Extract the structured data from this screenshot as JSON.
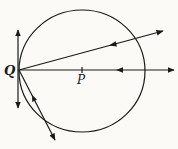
{
  "diagram": {
    "type": "geometry-optics",
    "labels": {
      "q": "Q",
      "p": "P"
    },
    "circle": {
      "cx": 82,
      "cy": 71,
      "rx": 63,
      "ry": 61
    },
    "point_q": {
      "x": 19,
      "y": 70
    },
    "point_p": {
      "x": 82,
      "y": 70
    },
    "lines": [
      {
        "name": "tangent-at-q",
        "x1": 18,
        "y1": 30,
        "x2": 18,
        "y2": 108,
        "arrows": "both"
      },
      {
        "name": "horizontal-ray-through-p",
        "x1": 19,
        "y1": 70,
        "x2": 174,
        "y2": 70,
        "arrows": "end",
        "mid_arrow": {
          "x": 120,
          "y": 70,
          "dir": "left"
        }
      },
      {
        "name": "upper-ray",
        "x1": 19,
        "y1": 70,
        "x2": 163,
        "y2": 31,
        "arrows": "end",
        "mid_arrow": {
          "x": 113,
          "y": 44.5,
          "dir": "toward-q"
        }
      },
      {
        "name": "lower-ray",
        "x1": 19,
        "y1": 70,
        "x2": 55,
        "y2": 140,
        "arrows": "end",
        "mid_arrow": {
          "x": 34,
          "y": 99,
          "dir": "toward-q"
        }
      }
    ],
    "colors": {
      "ink": "#1a1a1a",
      "paper": "#fbfaf7"
    }
  }
}
